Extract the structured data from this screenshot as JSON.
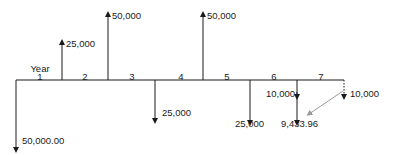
{
  "diagram": {
    "type": "cash-flow-diagram",
    "axis_title": "Year",
    "periods": [
      "1",
      "2",
      "3",
      "4",
      "5",
      "6",
      "7"
    ],
    "cash_flows": [
      {
        "at": "start",
        "direction": "down",
        "label": "50,000.00"
      },
      {
        "at": "end-1",
        "direction": "up",
        "label": "25,000"
      },
      {
        "at": "end-2",
        "direction": "up",
        "label": "50,000"
      },
      {
        "at": "end-3",
        "direction": "down",
        "label": "25,000"
      },
      {
        "at": "end-4",
        "direction": "up",
        "label": "50,000"
      },
      {
        "at": "end-5",
        "direction": "down",
        "label": "25,000"
      },
      {
        "at": "end-6",
        "direction": "down",
        "label_top": "10,000",
        "label_bottom": "9,433.96"
      },
      {
        "at": "end-7",
        "direction": "down",
        "style": "dotted",
        "label": "10,000",
        "discounted_to": "end-6"
      }
    ],
    "colors": {
      "line": "#1a1a1a",
      "discount_arrow": "#9a9a9a"
    }
  }
}
